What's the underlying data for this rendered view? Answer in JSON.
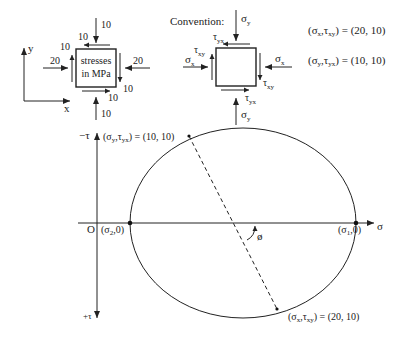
{
  "element": {
    "box_text_line1": "stresses",
    "box_text_line2": "in MPa",
    "axis_x": "x",
    "axis_y": "y",
    "top_load": "10",
    "bottom_load": "10",
    "left_load": "20",
    "right_load": "20",
    "shear_top": "10",
    "shear_left": "10",
    "shear_right": "10",
    "shear_bottom": "10"
  },
  "convention": {
    "title": "Convention:",
    "sigma_y_top": "σ",
    "sigma_y_top_sub": "y",
    "sigma_y_bottom": "σ",
    "sigma_y_bottom_sub": "y",
    "sigma_x_left": "σ",
    "sigma_x_left_sub": "x",
    "sigma_x_right": "σ",
    "sigma_x_right_sub": "x",
    "tau_yx_top": "τ",
    "tau_yx_top_sub": "yx",
    "tau_xy_left": "τ",
    "tau_xy_left_sub": "xy",
    "tau_xy_right": "τ",
    "tau_xy_right_sub": "xy",
    "tau_yx_bottom": "τ",
    "tau_yx_bottom_sub": "yx"
  },
  "state": {
    "x_face_lhs": "(σ",
    "x_face_sub1": "x",
    "x_face_mid": ",τ",
    "x_face_sub2": "xy",
    "x_face_rhs": ") = (20, 10)",
    "y_face_lhs": "(σ",
    "y_face_sub1": "y",
    "y_face_mid": ",τ",
    "y_face_sub2": "yx",
    "y_face_rhs": ") = (10, 10)"
  },
  "mohr": {
    "neg_tau_label": "−τ",
    "pos_tau_label": "+τ",
    "sigma_label": "σ",
    "origin_label": "O",
    "sigma2_label": "(σ",
    "sigma2_sub": "2",
    "sigma2_rest": ",0)",
    "sigma1_label": "(σ",
    "sigma1_sub": "1",
    "sigma1_rest": ",0)",
    "phi_label": "ø",
    "top_point_lhs": "(σ",
    "top_point_sub1": "y",
    "top_point_mid": ",τ",
    "top_point_sub2": "yx",
    "top_point_rhs": ") = (10, 10)",
    "bottom_point_lhs": "(σ",
    "bottom_point_sub1": "x",
    "bottom_point_mid": ",τ",
    "bottom_point_sub2": "xy",
    "bottom_point_rhs": ") = (20, 10)"
  }
}
